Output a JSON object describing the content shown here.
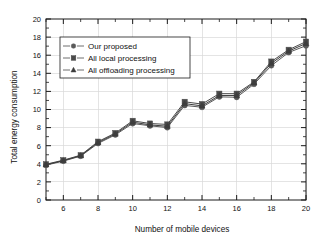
{
  "chart_data": {
    "type": "line",
    "title": "",
    "xlabel": "Number of mobile devices",
    "ylabel": "Total energy consumption",
    "xlim": [
      5,
      20
    ],
    "ylim": [
      0,
      20
    ],
    "x_ticks": [
      6,
      8,
      10,
      12,
      14,
      16,
      18,
      20
    ],
    "y_ticks": [
      0,
      2,
      4,
      6,
      8,
      10,
      12,
      14,
      16,
      18,
      20
    ],
    "x_minor_step": 1,
    "y_minor_step": 1,
    "grid": true,
    "legend_position": "upper-left",
    "x": [
      5,
      6,
      7,
      8,
      9,
      10,
      11,
      12,
      13,
      14,
      15,
      16,
      17,
      18,
      19,
      20
    ],
    "series": [
      {
        "name": "Our proposed",
        "marker": "circle",
        "color": "#5a5a5a",
        "values": [
          3.85,
          4.3,
          4.85,
          6.25,
          7.2,
          8.45,
          8.2,
          8.0,
          10.45,
          10.25,
          11.4,
          11.35,
          12.8,
          14.85,
          16.3,
          17.05
        ]
      },
      {
        "name": "All local processing",
        "marker": "square",
        "color": "#4a4a4a",
        "values": [
          3.95,
          4.4,
          4.95,
          6.45,
          7.4,
          8.75,
          8.45,
          8.35,
          10.85,
          10.6,
          11.75,
          11.75,
          13.05,
          15.3,
          16.6,
          17.5
        ]
      },
      {
        "name": "All offloading processing",
        "marker": "triangle",
        "color": "#3d3d3d",
        "values": [
          3.9,
          4.35,
          4.9,
          6.35,
          7.3,
          8.6,
          8.3,
          8.15,
          10.65,
          10.4,
          11.55,
          11.55,
          12.95,
          15.1,
          16.45,
          17.3
        ]
      }
    ]
  },
  "axis": {
    "x_title": "Number of mobile devices",
    "y_title": "Total energy consumption",
    "x_tick_labels": [
      "6",
      "8",
      "10",
      "12",
      "14",
      "16",
      "18",
      "20"
    ],
    "y_tick_labels": [
      "0",
      "2",
      "4",
      "6",
      "8",
      "10",
      "12",
      "14",
      "16",
      "18",
      "20"
    ]
  },
  "legend": {
    "entries": [
      {
        "label": "Our proposed",
        "marker": "circle"
      },
      {
        "label": "All local processing",
        "marker": "square"
      },
      {
        "label": "All offloading processing",
        "marker": "triangle"
      }
    ]
  },
  "colors": {
    "axis": "#1a1a1a",
    "grid": "#d8d8d8",
    "background": "#ffffff",
    "series_1": "#5a5a5a",
    "series_2": "#4a4a4a",
    "series_3": "#3d3d3d"
  }
}
